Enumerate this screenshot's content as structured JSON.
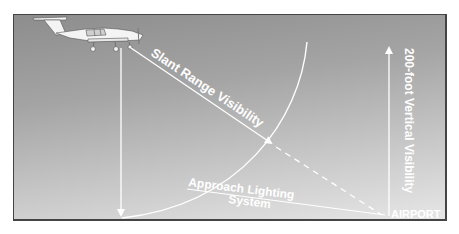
{
  "diagram": {
    "labels": {
      "slant_range": "Slant Range Visibility",
      "vertical": "200-foot Vertical Visibility",
      "approach_line1": "Approach Lighting",
      "approach_line2": "System",
      "airport": "AIRPORT"
    },
    "colors": {
      "background_top": "#8d8d8d",
      "background_bottom": "#e6e6e6",
      "lines": "#ffffff",
      "border": "#444444"
    }
  }
}
